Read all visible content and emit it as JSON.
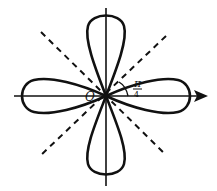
{
  "diagram": {
    "type": "polar-curve",
    "origin_label": "O",
    "angle_label": {
      "numerator": "π",
      "denominator": "4"
    },
    "colors": {
      "stroke": "#111111",
      "background": "#ffffff"
    }
  }
}
